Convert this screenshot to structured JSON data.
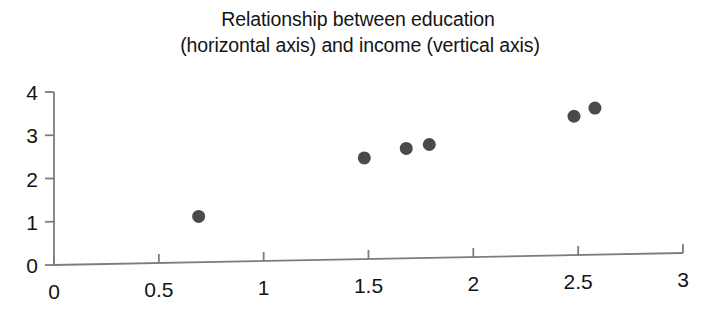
{
  "title": {
    "line1": "Relationship between education",
    "line2": "(horizontal axis) and income (vertical axis)"
  },
  "colors": {
    "marker": "#4a4a4a",
    "axis": "#7d7d7d",
    "text": "#141414",
    "background": "#ffffff"
  },
  "chart_data": {
    "type": "scatter",
    "title": "Relationship between education (horizontal axis) and income (vertical axis)",
    "xlabel": "",
    "ylabel": "",
    "xlim": [
      0,
      3
    ],
    "ylim": [
      0,
      4
    ],
    "xticks": [
      "0",
      "0.5",
      "1",
      "1.5",
      "2",
      "2.5",
      "3"
    ],
    "xtick_values": [
      0,
      0.5,
      1,
      1.5,
      2,
      2.5,
      3
    ],
    "yticks": [
      "0",
      "1",
      "2",
      "3",
      "4"
    ],
    "ytick_values": [
      0,
      1,
      2,
      3,
      4
    ],
    "grid": false,
    "legend": "none",
    "points": [
      {
        "x": 0.69,
        "y": 1.06
      },
      {
        "x": 1.48,
        "y": 2.34
      },
      {
        "x": 1.68,
        "y": 2.54
      },
      {
        "x": 1.79,
        "y": 2.62
      },
      {
        "x": 2.48,
        "y": 3.21
      },
      {
        "x": 2.58,
        "y": 3.39
      }
    ],
    "marker": {
      "shape": "circle",
      "size": 13,
      "color": "#4a4a4a"
    }
  }
}
